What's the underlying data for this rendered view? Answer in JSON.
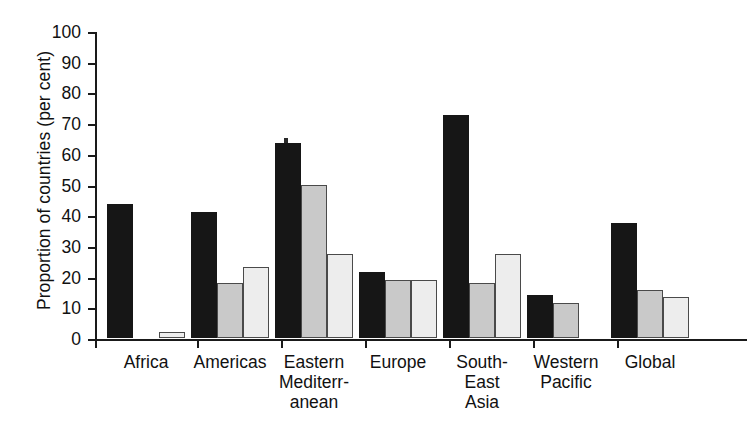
{
  "chart_data": {
    "type": "bar",
    "title": "",
    "xlabel": "",
    "ylabel": "Proportion of countries (per cent)",
    "ylim": [
      0,
      100
    ],
    "ytick_labels": [
      "100",
      "90",
      "80",
      "70",
      "60",
      "50",
      "40",
      "30",
      "20",
      "10",
      "0"
    ],
    "ytick_values": [
      100,
      90,
      80,
      70,
      60,
      50,
      40,
      30,
      20,
      10,
      0
    ],
    "grid": false,
    "legend": "none",
    "categories": [
      "Africa",
      "Americas",
      "Eastern Mediterr-anean",
      "Europe",
      "South-East Asia",
      "Western Pacific",
      "Global"
    ],
    "category_label_lines": [
      [
        "Africa"
      ],
      [
        "Americas"
      ],
      [
        "Eastern",
        "Mediterr-",
        "anean"
      ],
      [
        "Europe"
      ],
      [
        "South-",
        "East",
        "Asia"
      ],
      [
        "Western",
        "Pacific"
      ],
      [
        "Global"
      ]
    ],
    "series": [
      {
        "name": "series-1",
        "color": "#161616",
        "values": [
          43.5,
          41.0,
          63.5,
          21.5,
          72.5,
          14.0,
          37.5
        ]
      },
      {
        "name": "series-2",
        "color": "#c9c9c9",
        "values": [
          null,
          18.0,
          50.0,
          19.0,
          18.0,
          11.5,
          15.5
        ]
      },
      {
        "name": "series-3",
        "color": "#ededed",
        "values": [
          2.0,
          23.0,
          27.5,
          19.0,
          27.5,
          null,
          13.5
        ]
      }
    ]
  },
  "colors": {
    "axis": "#1a1a1a",
    "background": "#ffffff",
    "text": "#111111",
    "series_dark": "#161616",
    "series_medium": "#c9c9c9",
    "series_light": "#ededed"
  }
}
